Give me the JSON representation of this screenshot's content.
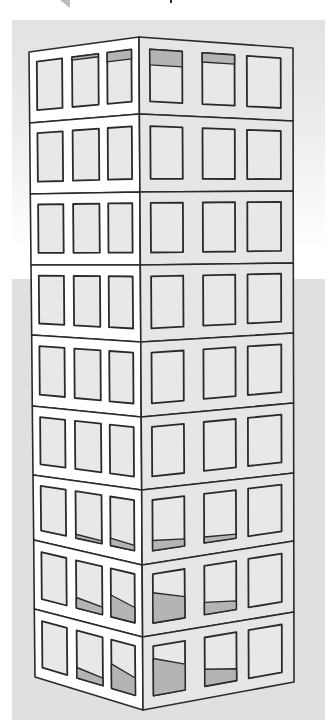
{
  "figure": {
    "floors": 9,
    "windows_per_face": 3,
    "colors": {
      "background_gradient_top": "#e2e2e2",
      "background_lower": "#e0e0e0",
      "left_face": "#ffffff",
      "right_face": "#e6e6e6",
      "window_glass": "#e8e8e8",
      "window_shade": "#b4b4b4",
      "outline": "#2a2a2a"
    },
    "edges": {
      "left": {
        "x_top": 29,
        "x_bottom": 35,
        "floor_y": [
          52,
          123,
          194,
          265,
          335,
          406,
          475,
          540,
          609,
          677
        ]
      },
      "corner": {
        "x_top": 139,
        "x_bottom": 143,
        "floor_y": [
          37,
          114,
          192,
          265,
          342,
          417,
          490,
          565,
          637,
          710
        ]
      },
      "right": {
        "x_top": 293,
        "x_bottom": 294,
        "floor_y": [
          48,
          121,
          191,
          263,
          333,
          403,
          473,
          541,
          612,
          682
        ]
      }
    },
    "left_windows_u": [
      [
        0.07,
        0.3
      ],
      [
        0.39,
        0.63
      ],
      [
        0.71,
        0.93
      ]
    ],
    "right_windows_u": [
      [
        0.07,
        0.28
      ],
      [
        0.41,
        0.62
      ],
      [
        0.7,
        0.92
      ]
    ],
    "window_v": [
      0.15,
      0.83
    ],
    "shading": [
      {
        "floor": 0,
        "face": "left",
        "window": 1,
        "type": "top",
        "amount": 0.06
      },
      {
        "floor": 0,
        "face": "left",
        "window": 2,
        "type": "top",
        "amount": 0.18
      },
      {
        "floor": 0,
        "face": "right",
        "window": 0,
        "type": "top",
        "amount": 0.3
      },
      {
        "floor": 0,
        "face": "right",
        "window": 1,
        "type": "top",
        "amount": 0.18
      },
      {
        "floor": 6,
        "face": "left",
        "window": 1,
        "type": "bottom",
        "amount": 0.08
      },
      {
        "floor": 6,
        "face": "left",
        "window": 2,
        "type": "bottom",
        "amount": 0.15
      },
      {
        "floor": 6,
        "face": "right",
        "window": 0,
        "type": "bottom",
        "amount": 0.2
      },
      {
        "floor": 6,
        "face": "right",
        "window": 1,
        "type": "bottom",
        "amount": 0.12
      },
      {
        "floor": 7,
        "face": "left",
        "window": 1,
        "type": "bottom",
        "amount": 0.22
      },
      {
        "floor": 7,
        "face": "left",
        "window": 2,
        "type": "bottom",
        "amount": 0.45
      },
      {
        "floor": 7,
        "face": "right",
        "window": 0,
        "type": "bottom",
        "amount": 0.62
      },
      {
        "floor": 7,
        "face": "right",
        "window": 1,
        "type": "bottom",
        "amount": 0.25
      },
      {
        "floor": 8,
        "face": "left",
        "window": 1,
        "type": "bottom",
        "amount": 0.22
      },
      {
        "floor": 8,
        "face": "left",
        "window": 2,
        "type": "bottom",
        "amount": 0.5
      },
      {
        "floor": 8,
        "face": "right",
        "window": 0,
        "type": "bottom",
        "amount": 0.75
      },
      {
        "floor": 8,
        "face": "right",
        "window": 1,
        "type": "bottom",
        "amount": 0.35
      }
    ]
  }
}
